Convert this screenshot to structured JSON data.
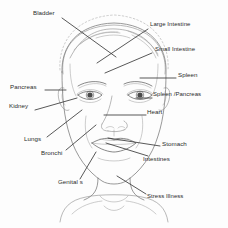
{
  "diagram": {
    "style": {
      "background": "#fdfdfd",
      "sketch_line_color": "#6e6e6e",
      "leader_line_color": "#3a3a3a",
      "text_color": "#2b2b2b"
    },
    "labels": [
      {
        "id": "bladder",
        "text": "Bladder",
        "x": 33,
        "y": 13,
        "anchor": "left"
      },
      {
        "id": "large-intestine",
        "text": "Large Intestine",
        "x": 150,
        "y": 25,
        "anchor": "left"
      },
      {
        "id": "small-intestine",
        "text": "Small Intestine",
        "x": 155,
        "y": 50,
        "anchor": "left"
      },
      {
        "id": "spleen",
        "text": "Spleen",
        "x": 178,
        "y": 75,
        "anchor": "left"
      },
      {
        "id": "spleen-pancreas",
        "text": "Spleen /Pancreas",
        "x": 153,
        "y": 95,
        "anchor": "left"
      },
      {
        "id": "pancreas",
        "text": "Pancreas",
        "x": 10,
        "y": 87,
        "anchor": "left"
      },
      {
        "id": "kidney",
        "text": "Kidney",
        "x": 9,
        "y": 106,
        "anchor": "left"
      },
      {
        "id": "heart",
        "text": "Heart",
        "x": 147,
        "y": 112,
        "anchor": "left"
      },
      {
        "id": "lungs",
        "text": "Lungs",
        "x": 24,
        "y": 139,
        "anchor": "left"
      },
      {
        "id": "bronchi",
        "text": "Bronchi",
        "x": 41,
        "y": 153,
        "anchor": "left"
      },
      {
        "id": "stomach",
        "text": "Stomach",
        "x": 162,
        "y": 144,
        "anchor": "left"
      },
      {
        "id": "intestines",
        "text": "Intestines",
        "x": 143,
        "y": 159,
        "anchor": "left"
      },
      {
        "id": "genitals",
        "text": "Genital s",
        "x": 58,
        "y": 182,
        "anchor": "left"
      },
      {
        "id": "stress-illness",
        "text": "Stress Illness",
        "x": 147,
        "y": 197,
        "anchor": "left"
      }
    ],
    "leader_lines": [
      {
        "id": "bladder",
        "x1": 62,
        "y1": 18,
        "x2": 116,
        "y2": 57
      },
      {
        "id": "large-intestine",
        "x1": 148,
        "y1": 29,
        "x2": 97,
        "y2": 63
      },
      {
        "id": "small-intestine",
        "x1": 152,
        "y1": 53,
        "x2": 105,
        "y2": 73
      },
      {
        "id": "spleen",
        "x1": 176,
        "y1": 78,
        "x2": 140,
        "y2": 78
      },
      {
        "id": "spleen-pancreas",
        "x1": 152,
        "y1": 98,
        "x2": 136,
        "y2": 98
      },
      {
        "id": "pancreas",
        "x1": 45,
        "y1": 90,
        "x2": 66,
        "y2": 90
      },
      {
        "id": "kidney",
        "x1": 35,
        "y1": 110,
        "x2": 77,
        "y2": 98
      },
      {
        "id": "heart",
        "x1": 146,
        "y1": 115,
        "x2": 104,
        "y2": 115
      },
      {
        "id": "lungs",
        "x1": 47,
        "y1": 137,
        "x2": 82,
        "y2": 110
      },
      {
        "id": "bronchi",
        "x1": 66,
        "y1": 150,
        "x2": 96,
        "y2": 125
      },
      {
        "id": "stomach",
        "x1": 160,
        "y1": 146,
        "x2": 108,
        "y2": 138
      },
      {
        "id": "intestines",
        "x1": 148,
        "y1": 156,
        "x2": 106,
        "y2": 143
      },
      {
        "id": "genitals",
        "x1": 80,
        "y1": 179,
        "x2": 96,
        "y2": 152
      },
      {
        "id": "stress-illness",
        "x1": 146,
        "y1": 194,
        "x2": 117,
        "y2": 176
      }
    ]
  }
}
